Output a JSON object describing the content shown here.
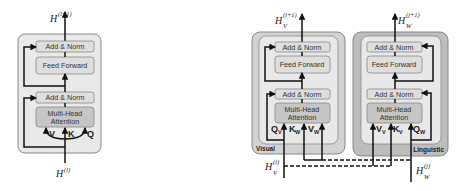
{
  "left_block": {
    "output_label": "H",
    "output_sup": "(l+1)",
    "input_label": "H",
    "input_sup": "(l)",
    "add_norm_top": "Add & Norm",
    "feed_forward": "Feed Forward",
    "add_norm_bottom": "Add & Norm",
    "mha_line1": "Multi-Head",
    "mha_line2": "Attention",
    "v": "V",
    "k": "K",
    "q": "Q"
  },
  "visual_block": {
    "tag": "Visual",
    "output_label": "H",
    "output_sub": "V",
    "output_sup": "(i+1)",
    "input_label": "H",
    "input_sub": "V",
    "input_sup": "(i)",
    "add_norm_top": "Add & Norm",
    "feed_forward": "Feed Forward",
    "add_norm_bottom": "Add & Norm",
    "mha_line1": "Multi-Head",
    "mha_line2": "Attention",
    "q": "Q",
    "q_sub": "V",
    "k": "K",
    "k_sub": "W",
    "v": "V",
    "v_sub": "W"
  },
  "linguistic_block": {
    "tag": "Linguistic",
    "output_label": "H",
    "output_sub": "W",
    "output_sup": "(j+1)",
    "input_label": "H",
    "input_sub": "W",
    "input_sup": "(j)",
    "add_norm_top": "Add & Norm",
    "feed_forward": "Feed Forward",
    "add_norm_bottom": "Add & Norm",
    "mha_line1": "Multi-Head",
    "mha_line2": "Attention",
    "v": "V",
    "v_sub": "V",
    "k": "K",
    "k_sub": "V",
    "q": "Q",
    "q_sub": "W"
  },
  "colors": {
    "outer_light": "#e9e9e9",
    "outer_visual": "#d2d2d2",
    "outer_linguistic": "#bdbdbd",
    "inner_light": "#e8e8e8",
    "box_fill": "#dedede",
    "mha_fill": "#c6c6c6",
    "line": "#111111"
  }
}
